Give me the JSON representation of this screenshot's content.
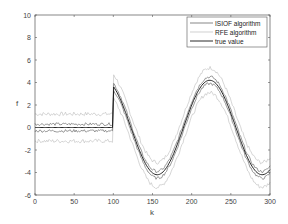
{
  "chart_data": {
    "type": "line",
    "title": "",
    "xlabel": "k",
    "ylabel": "f",
    "xlim": [
      0,
      300
    ],
    "ylim": [
      -6,
      10
    ],
    "xticks": [
      0,
      50,
      100,
      150,
      200,
      250,
      300
    ],
    "yticks": [
      -6,
      -4,
      -2,
      0,
      2,
      4,
      6,
      8,
      10
    ],
    "grid": false,
    "legend_position": "upper right",
    "legend": [
      "ISIOF algorithm",
      "RFE algorithm",
      "true value"
    ],
    "series": [
      {
        "name": "true value",
        "x": [
          0,
          99,
          100,
          125,
          156,
          190,
          223,
          256,
          290,
          300
        ],
        "values": [
          0,
          0,
          3.7,
          0.5,
          -4.2,
          -0.2,
          4.2,
          0.2,
          -4.2,
          -3.6
        ]
      },
      {
        "name": "ISIOF algorithm (upper)",
        "x": [
          0,
          99,
          100,
          156,
          223,
          290,
          300
        ],
        "values": [
          0.3,
          0.3,
          4.0,
          -3.9,
          4.5,
          -3.9,
          -3.3
        ]
      },
      {
        "name": "ISIOF algorithm (lower)",
        "x": [
          0,
          99,
          100,
          156,
          223,
          290,
          300
        ],
        "values": [
          -0.3,
          -0.3,
          3.4,
          -4.5,
          3.9,
          -4.5,
          -3.9
        ]
      },
      {
        "name": "RFE algorithm (upper)",
        "x": [
          0,
          99,
          100,
          156,
          223,
          290,
          300
        ],
        "values": [
          1.2,
          1.2,
          5.2,
          -2.9,
          5.4,
          -2.9,
          -2.4
        ]
      },
      {
        "name": "RFE algorithm (lower)",
        "x": [
          0,
          99,
          100,
          156,
          223,
          290,
          300
        ],
        "values": [
          -1.2,
          -1.2,
          2.5,
          -5.4,
          3.0,
          -5.4,
          -4.8
        ]
      }
    ],
    "colors": {
      "isiof": "#555555",
      "rfe": "#bbbbbb",
      "true": "#111111",
      "axis": "#555555"
    }
  }
}
